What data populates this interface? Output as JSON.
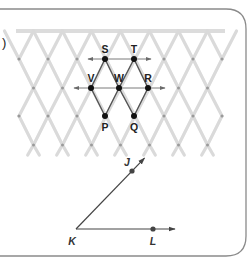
{
  "figure": {
    "part_marker": ")",
    "lattice": {
      "top_bar_color": "#dcdcdc",
      "strut_color": "#dadada",
      "node_color": "#9a9a9a",
      "columns_x": [
        19,
        48,
        77,
        106,
        135,
        164,
        193,
        222
      ],
      "rows_y": [
        59,
        88,
        116,
        145
      ]
    },
    "points": [
      {
        "label": "S",
        "x": 105,
        "y": 59
      },
      {
        "label": "T",
        "x": 134,
        "y": 59
      },
      {
        "label": "V",
        "x": 91,
        "y": 88
      },
      {
        "label": "W",
        "x": 119,
        "y": 88
      },
      {
        "label": "R",
        "x": 148,
        "y": 88
      },
      {
        "label": "P",
        "x": 105,
        "y": 116
      },
      {
        "label": "Q",
        "x": 134,
        "y": 116
      }
    ],
    "lines": [
      {
        "name": "line-ST",
        "through": [
          "S",
          "T"
        ]
      },
      {
        "name": "line-VR",
        "through": [
          "V",
          "W",
          "R"
        ]
      }
    ],
    "rhombi": [
      [
        "S",
        "W",
        "P",
        "V"
      ],
      [
        "T",
        "R",
        "Q",
        "W"
      ]
    ],
    "angle": {
      "vertex": {
        "label": "K",
        "x": 76,
        "y": 229
      },
      "ray1_point": {
        "label": "J",
        "x": 132,
        "y": 171
      },
      "ray2_point": {
        "label": "L",
        "x": 153,
        "y": 229
      },
      "name": "angle JKL"
    },
    "colors": {
      "frame": "#8a8a8a",
      "ink": "#222222",
      "construction_line": "#7a7a7a"
    }
  }
}
